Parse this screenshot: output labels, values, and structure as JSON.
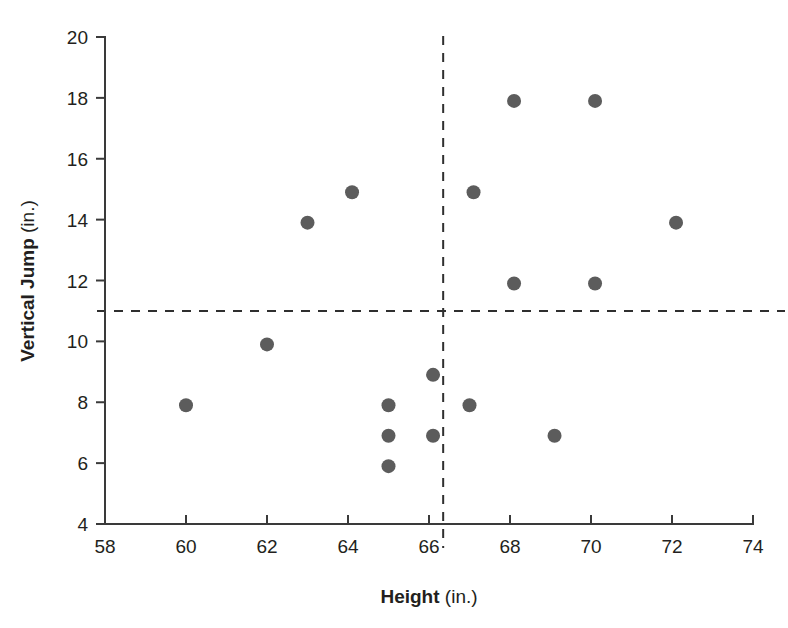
{
  "chart_data": {
    "type": "scatter",
    "title": "",
    "subtitle": "",
    "xlabel_bold": "Height",
    "xlabel_unit": "(in.)",
    "ylabel_bold": "Vertical Jump",
    "ylabel_unit": "(in.)",
    "xlim": [
      58,
      74
    ],
    "ylim": [
      4,
      20
    ],
    "xticks": [
      58,
      60,
      62,
      64,
      66,
      68,
      70,
      72,
      74
    ],
    "yticks": [
      4,
      6,
      8,
      10,
      12,
      14,
      16,
      18,
      20
    ],
    "xtick_labels": [
      "58",
      "60",
      "62",
      "64",
      "66",
      "68",
      "70",
      "72",
      "74"
    ],
    "ytick_labels": [
      "4",
      "6",
      "8",
      "10",
      "12",
      "14",
      "16",
      "18",
      "20"
    ],
    "grid": false,
    "legend": null,
    "point_color": "#5c5c5c",
    "point_radius": 7,
    "reference_lines": [
      {
        "name": "mean-height-vertical",
        "orientation": "vertical",
        "value": 66.35,
        "style": "dashed",
        "color": "#2f2f2f"
      },
      {
        "name": "mean-jump-horizontal",
        "orientation": "horizontal",
        "value": 11.0,
        "style": "dashed",
        "color": "#2f2f2f"
      }
    ],
    "x": [
      60.0,
      62.0,
      63.0,
      64.1,
      65.0,
      65.0,
      65.0,
      66.1,
      66.1,
      67.0,
      67.1,
      68.1,
      68.1,
      69.1,
      70.1,
      70.1,
      72.1
    ],
    "y": [
      7.9,
      9.9,
      13.9,
      14.9,
      5.9,
      6.9,
      7.9,
      6.9,
      8.9,
      7.9,
      14.9,
      11.9,
      17.9,
      6.9,
      11.9,
      17.9,
      13.9
    ],
    "points": [
      {
        "x": 60.0,
        "y": 7.9
      },
      {
        "x": 62.0,
        "y": 9.9
      },
      {
        "x": 63.0,
        "y": 13.9
      },
      {
        "x": 64.1,
        "y": 14.9
      },
      {
        "x": 65.0,
        "y": 5.9
      },
      {
        "x": 65.0,
        "y": 6.9
      },
      {
        "x": 65.0,
        "y": 7.9
      },
      {
        "x": 66.1,
        "y": 6.9
      },
      {
        "x": 66.1,
        "y": 8.9
      },
      {
        "x": 67.0,
        "y": 7.9
      },
      {
        "x": 67.1,
        "y": 14.9
      },
      {
        "x": 68.1,
        "y": 11.9
      },
      {
        "x": 68.1,
        "y": 17.9
      },
      {
        "x": 69.1,
        "y": 6.9
      },
      {
        "x": 70.1,
        "y": 11.9
      },
      {
        "x": 70.1,
        "y": 17.9
      },
      {
        "x": 72.1,
        "y": 13.9
      }
    ]
  }
}
